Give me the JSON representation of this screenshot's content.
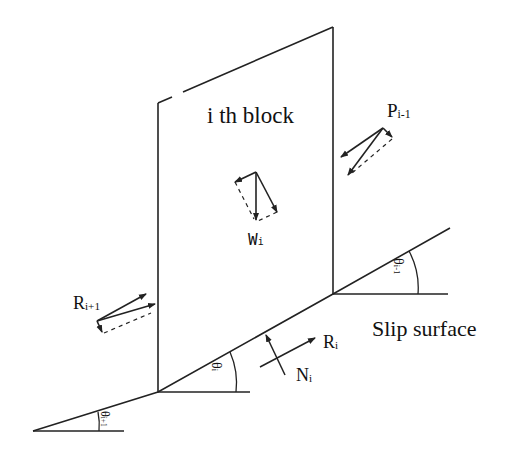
{
  "diagram": {
    "title": "i th block",
    "slip_surface_label": "Slip surface",
    "forces": {
      "P": {
        "symbol": "P",
        "subscript": "i-1"
      },
      "W": {
        "symbol": "W",
        "subscript": "i"
      },
      "R_next": {
        "symbol": "R",
        "subscript": "i+1"
      },
      "R": {
        "symbol": "R",
        "subscript": "i"
      },
      "N": {
        "symbol": "N",
        "subscript": "i"
      }
    },
    "angles": {
      "theta_i": {
        "symbol": "θ",
        "subscript": "i"
      },
      "theta_prev": {
        "symbol": "θ",
        "subscript": "i-1"
      },
      "theta_next": {
        "symbol": "θ",
        "subscript": "i+1"
      }
    },
    "colors": {
      "line": "#222222",
      "background": "#ffffff"
    }
  }
}
